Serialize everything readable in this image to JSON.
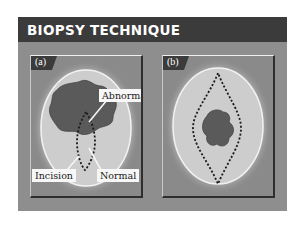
{
  "title": "BIOPSY TECHNIQUE",
  "colors": {
    "header_bg": "#3b3b3b",
    "figure_bg": "#8e8e8e",
    "skin": "#cdcdcd",
    "lesion": "#5a5a5a",
    "label_bg": "#f7f7f7"
  },
  "panels": [
    {
      "tag": "(a)",
      "labels": {
        "abnormal": "Abnormal",
        "incision": "Incision",
        "normal": "Normal"
      }
    },
    {
      "tag": "(b)"
    }
  ]
}
